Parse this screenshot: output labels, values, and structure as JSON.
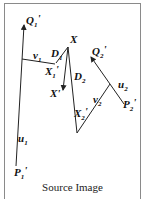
{
  "diagram": {
    "caption": "Source Image",
    "labels": {
      "Q1": "Q",
      "Q1_sub": "1",
      "Q1_prime": "'",
      "P1": "P",
      "P1_sub": "1",
      "P1_prime": "'",
      "u1": "u",
      "u1_sub": "1",
      "v1": "v",
      "v1_sub": "1",
      "X": "X",
      "D1": "D",
      "D1_sub": "1",
      "X1": "X",
      "X1_sub": "1",
      "X1_prime": "'",
      "Xp": "X'",
      "D2": "D",
      "D2_sub": "2",
      "Q2": "Q",
      "Q2_sub": "2",
      "Q2_prime": "'",
      "u2": "u",
      "u2_sub": "2",
      "v2": "v",
      "v2_sub": "2",
      "X2": "X",
      "X2_sub": "2",
      "X2_prime": "'",
      "P2": "P",
      "P2_sub": "2",
      "P2_prime": "'"
    },
    "colors": {
      "stroke": "#222222",
      "frame": "#8a8a8a"
    }
  }
}
